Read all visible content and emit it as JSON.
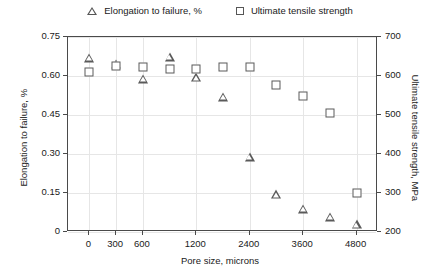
{
  "chart_data": {
    "type": "scatter",
    "title": "",
    "xlabel": "Pore size, microns",
    "ylabel": "Elongation to failure, %",
    "y2label": "Ultimate tensile strength, MPa",
    "grid": true,
    "legend_position": "top",
    "ylim": [
      0,
      0.75
    ],
    "y2lim": [
      200,
      700
    ],
    "yticks": [
      "0",
      "0.15",
      "0.30",
      "0.45",
      "0.60",
      "0.75"
    ],
    "ytick_values": [
      0,
      0.15,
      0.3,
      0.45,
      0.6,
      0.75
    ],
    "y2ticks": [
      "200",
      "300",
      "400",
      "500",
      "600",
      "700"
    ],
    "y2tick_values": [
      200,
      300,
      400,
      500,
      600,
      700
    ],
    "xticks": [
      "0",
      "300",
      "600",
      "1200",
      "2400",
      "3600",
      "4800"
    ],
    "x_positions": [
      0,
      300,
      600,
      1200,
      2400,
      3600,
      4800
    ],
    "series": [
      {
        "name": "Elongation to failure, %",
        "marker": "triangle",
        "axis": "left",
        "color": "#5a5a5a",
        "points": [
          {
            "x": 0,
            "y": 0.67
          },
          {
            "x": 300,
            "y": 0.645
          },
          {
            "x": 600,
            "y": 0.59
          },
          {
            "x": 900,
            "y": 0.675
          },
          {
            "x": 1200,
            "y": 0.595
          },
          {
            "x": 1800,
            "y": 0.52
          },
          {
            "x": 2400,
            "y": 0.29
          },
          {
            "x": 3000,
            "y": 0.145
          },
          {
            "x": 3600,
            "y": 0.09
          },
          {
            "x": 4200,
            "y": 0.058
          },
          {
            "x": 4800,
            "y": 0.03
          }
        ]
      },
      {
        "name": "Ultimate tensile strength",
        "marker": "square",
        "axis": "right",
        "color": "#5a5a5a",
        "points": [
          {
            "x": 0,
            "y": 610
          },
          {
            "x": 300,
            "y": 625
          },
          {
            "x": 600,
            "y": 622
          },
          {
            "x": 900,
            "y": 618
          },
          {
            "x": 1200,
            "y": 618
          },
          {
            "x": 1800,
            "y": 622
          },
          {
            "x": 2400,
            "y": 622
          },
          {
            "x": 3000,
            "y": 578
          },
          {
            "x": 3600,
            "y": 548
          },
          {
            "x": 4200,
            "y": 505
          },
          {
            "x": 4800,
            "y": 300
          }
        ]
      }
    ],
    "legend": [
      {
        "label": "Elongation to failure, %",
        "marker": "triangle"
      },
      {
        "label": "Ultimate tensile strength",
        "marker": "square"
      }
    ]
  }
}
